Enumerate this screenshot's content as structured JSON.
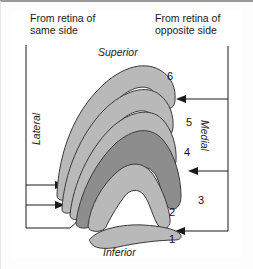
{
  "figure": {
    "title_alt": "Layers of the lateral geniculate nucleus",
    "background_color": "#ffffff",
    "frame_color": "#9a9a9a"
  },
  "captions": {
    "left_line1": "From retina of",
    "left_line2": "same side",
    "right_line1": "From retina of",
    "right_line2": "opposite side"
  },
  "orientation": {
    "superior": "Superior",
    "inferior": "Inferior",
    "lateral": "Lateral",
    "medial": "Medial"
  },
  "layers": [
    {
      "number": "1",
      "shade": "light",
      "fill": "#b9b9b9",
      "input": "opposite"
    },
    {
      "number": "2",
      "shade": "light",
      "fill": "#b9b9b9",
      "input": "same"
    },
    {
      "number": "3",
      "shade": "dark",
      "fill": "#8d8d8d",
      "input": "same"
    },
    {
      "number": "4",
      "shade": "light",
      "fill": "#b9b9b9",
      "input": "opposite"
    },
    {
      "number": "5",
      "shade": "light",
      "fill": "#b9b9b9",
      "input": "same"
    },
    {
      "number": "6",
      "shade": "light",
      "fill": "#b9b9b9",
      "input": "opposite"
    }
  ],
  "layer_numbers": [
    "1",
    "2",
    "3",
    "4",
    "5",
    "6"
  ],
  "colors": {
    "light_gray": "#b9b9b9",
    "dark_gray": "#8d8d8d",
    "outline": "#3a3a3a",
    "text": "#1a1a1a"
  },
  "arrows": {
    "left_count": 3,
    "right_count": 3,
    "left_targets": [
      "band-outer",
      "band-inner",
      "layer-2"
    ],
    "right_targets": [
      "layer-6",
      "layer-4",
      "layer-1"
    ]
  }
}
